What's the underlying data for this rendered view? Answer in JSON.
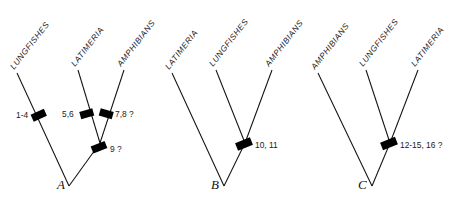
{
  "figure": {
    "title": "",
    "background_color": "#ffffff",
    "line_color": "#111111",
    "bar_color": "#000000"
  },
  "panels": [
    {
      "letter": "A",
      "taxa": [
        "LUNGFISHES",
        "LATIMERIA",
        "AMPHIBIANS"
      ],
      "characters": [
        "1-4",
        "5,6",
        "7,8 ?",
        "9 ?"
      ],
      "char_1": "1-4",
      "char_2": "5,6",
      "char_3": "7,8 ?",
      "char_4": "9 ?",
      "tip_1": "LUNGFISHES",
      "tip_2": "LATIMERIA",
      "tip_3": "AMPHIBIANS"
    },
    {
      "letter": "B",
      "taxa": [
        "LATIMERIA",
        "LUNGFISHES",
        "AMPHIBIANS"
      ],
      "characters": [
        "10, 11"
      ],
      "char_1": "10, 11",
      "tip_1": "LATIMERIA",
      "tip_2": "LUNGFISHES",
      "tip_3": "AMPHIBIANS"
    },
    {
      "letter": "C",
      "taxa": [
        "AMPHIBIANS",
        "LUNGFISHES",
        "LATIMERIA"
      ],
      "characters": [
        "12-15, 16 ?"
      ],
      "char_1": "12-15, 16 ?",
      "tip_1": "AMPHIBIANS",
      "tip_2": "LUNGFISHES",
      "tip_3": "LATIMERIA"
    }
  ]
}
